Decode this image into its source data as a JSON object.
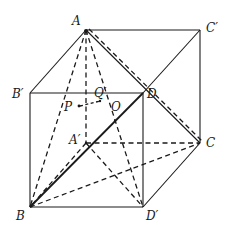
{
  "figure": {
    "type": "geometry-cube",
    "stroke_color": "#1a1a1a",
    "background": "#ffffff",
    "vertices": {
      "A": {
        "label": "A",
        "x": 86,
        "y": 30
      },
      "C1": {
        "label": "C′",
        "x": 200,
        "y": 30
      },
      "B1": {
        "label": "B′",
        "x": 30,
        "y": 93
      },
      "D": {
        "label": "D",
        "x": 143,
        "y": 93
      },
      "A1": {
        "label": "A′",
        "x": 86,
        "y": 143
      },
      "C": {
        "label": "C",
        "x": 200,
        "y": 143
      },
      "B": {
        "label": "B",
        "x": 30,
        "y": 207
      },
      "D1": {
        "label": "D′",
        "x": 143,
        "y": 207
      }
    },
    "points": {
      "Q1": {
        "label": "Q′",
        "x": 100,
        "y": 93
      },
      "P": {
        "label": "P",
        "x": 79,
        "y": 106
      },
      "O": {
        "label": "O",
        "x": 115,
        "y": 118
      }
    },
    "solid_edges": [
      [
        "A",
        "C1"
      ],
      [
        "C1",
        "C"
      ],
      [
        "A",
        "B1"
      ],
      [
        "B1",
        "D"
      ],
      [
        "B1",
        "B"
      ],
      [
        "B",
        "D1"
      ],
      [
        "D1",
        "D"
      ],
      [
        "D",
        "C1"
      ],
      [
        "A",
        "D"
      ],
      [
        "D1",
        "C"
      ]
    ],
    "thick_edges": [
      [
        "B",
        "D"
      ]
    ],
    "dashed_edges": [
      [
        "A",
        "A1"
      ],
      [
        "A1",
        "C"
      ],
      [
        "A1",
        "B"
      ],
      [
        "A1",
        "D1"
      ],
      [
        "B",
        "C"
      ],
      [
        "A",
        "B"
      ],
      [
        "A",
        "D1"
      ],
      [
        "A",
        "C"
      ],
      [
        "P",
        "Q1"
      ]
    ]
  },
  "labels": {
    "A": "A",
    "C1": "C′",
    "B1": "B′",
    "D": "D",
    "Q1": "Q′",
    "P": "P",
    "O": "O",
    "A1": "A′",
    "C": "C",
    "B": "B",
    "D1": "D′"
  }
}
